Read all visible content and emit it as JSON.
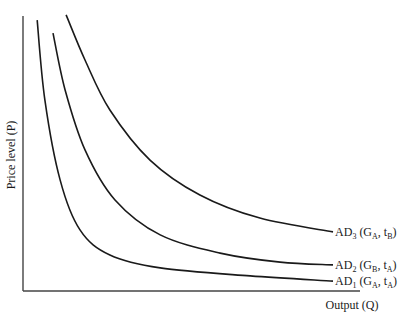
{
  "chart_data": {
    "type": "line",
    "title": "",
    "xlabel": "Output (Q)",
    "ylabel": "Price level (P)",
    "xlim": [
      0,
      1
    ],
    "ylim": [
      0,
      1
    ],
    "grid": false,
    "ticks": false,
    "series": [
      {
        "name": "AD1 (GA, tA)",
        "label": {
          "main": "AD",
          "sub": "1",
          "args": [
            {
              "t": "G",
              "s": "A"
            },
            {
              "t": "t",
              "s": "A"
            }
          ]
        },
        "points": [
          [
            0.042,
            0.985
          ],
          [
            0.065,
            0.694
          ],
          [
            0.11,
            0.404
          ],
          [
            0.169,
            0.222
          ],
          [
            0.258,
            0.131
          ],
          [
            0.407,
            0.084
          ],
          [
            0.674,
            0.055
          ],
          [
            0.92,
            0.036
          ]
        ]
      },
      {
        "name": "AD2 (GB, tA)",
        "label": {
          "main": "AD",
          "sub": "2",
          "args": [
            {
              "t": "G",
              "s": "B"
            },
            {
              "t": "t",
              "s": "A"
            }
          ]
        },
        "points": [
          [
            0.089,
            0.938
          ],
          [
            0.125,
            0.731
          ],
          [
            0.184,
            0.513
          ],
          [
            0.273,
            0.331
          ],
          [
            0.407,
            0.204
          ],
          [
            0.585,
            0.138
          ],
          [
            0.763,
            0.105
          ],
          [
            0.92,
            0.095
          ]
        ]
      },
      {
        "name": "AD3 (GA, tB)",
        "label": {
          "main": "AD",
          "sub": "3",
          "args": [
            {
              "t": "G",
              "s": "A"
            },
            {
              "t": "t",
              "s": "B"
            }
          ]
        },
        "points": [
          [
            0.128,
            1.004
          ],
          [
            0.184,
            0.84
          ],
          [
            0.258,
            0.658
          ],
          [
            0.377,
            0.476
          ],
          [
            0.525,
            0.349
          ],
          [
            0.703,
            0.265
          ],
          [
            0.92,
            0.215
          ]
        ]
      }
    ]
  }
}
